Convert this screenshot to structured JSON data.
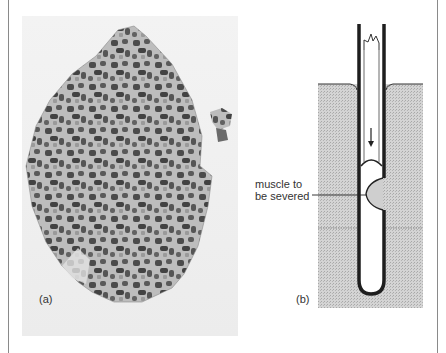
{
  "figure": {
    "panel_a": {
      "label": "(a)",
      "description": "micrograph of muscle cross-section with dark and light stained fibres"
    },
    "panel_b": {
      "label": "(b)",
      "annotation": {
        "line1": "muscle to",
        "line2": "be severed"
      }
    }
  },
  "colors": {
    "frame": "#8a8a8a",
    "tissue_light": "#b9b9b9",
    "tissue_dark": "#4a4a4a",
    "stipple": "#cfcfcf",
    "tube": "#222222"
  }
}
